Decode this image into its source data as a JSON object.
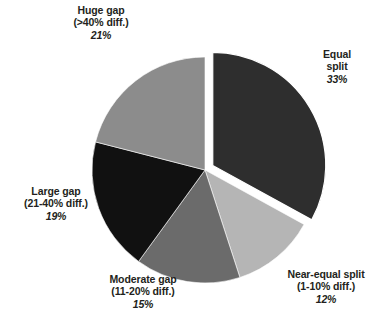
{
  "chart_data": {
    "type": "pie",
    "title": "",
    "subtitle": "",
    "xlabel": "",
    "ylabel": "",
    "legend_position": "none",
    "grid": false,
    "units": "percent",
    "total": 100,
    "start_angle_deg": 0,
    "direction": "clockwise",
    "categories": [
      "Equal split",
      "Near-equal split (1-10% diff.)",
      "Moderate gap (11-20% diff.)",
      "Large gap (21-40% diff.)",
      "Huge gap (>40% diff.)"
    ],
    "values": [
      33,
      12,
      15,
      19,
      21
    ],
    "colors": [
      "#2e2e2e",
      "#b5b5b5",
      "#6b6b6b",
      "#111111",
      "#8c8c8c"
    ],
    "exploded": [
      "Equal split"
    ],
    "slices": [
      {
        "name": "equal-split",
        "line1": "Equal",
        "line2": "split",
        "line3": "",
        "percent": "33%",
        "value": 33,
        "color": "#2e2e2e",
        "exploded": true
      },
      {
        "name": "near-equal-split",
        "line1": "Near-equal split",
        "line2": "(1-10% diff.)",
        "line3": "",
        "percent": "12%",
        "value": 12,
        "color": "#b5b5b5",
        "exploded": false
      },
      {
        "name": "moderate-gap",
        "line1": "Moderate gap",
        "line2": "(11-20% diff.)",
        "line3": "",
        "percent": "15%",
        "value": 15,
        "color": "#6b6b6b",
        "exploded": false
      },
      {
        "name": "large-gap",
        "line1": "Large gap",
        "line2": "(21-40% diff.)",
        "line3": "",
        "percent": "19%",
        "value": 19,
        "color": "#111111",
        "exploded": false
      },
      {
        "name": "huge-gap",
        "line1": "Huge gap",
        "line2": "(>40% diff.)",
        "line3": "",
        "percent": "21%",
        "value": 21,
        "color": "#8c8c8c",
        "exploded": false
      }
    ],
    "geometry": {
      "center_x": 205,
      "center_y": 170,
      "radius": 113,
      "explode_offset": 9,
      "background": "#ffffff"
    }
  }
}
